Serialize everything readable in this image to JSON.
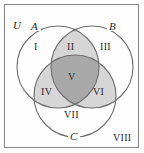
{
  "figure": {
    "kind": "venn-diagram-three-sets",
    "background_color": "#fefefe",
    "frame_color": "#8a8a8a",
    "outline_color": "#6e6e6e",
    "shade_light": "#d6d6d6",
    "shade_dark": "#a9a9a9",
    "text_color": "#2a2a2a"
  },
  "universe": {
    "label": "U"
  },
  "sets": [
    {
      "id": "A",
      "label": "A",
      "position": "top-left"
    },
    {
      "id": "B",
      "label": "B",
      "position": "top-right"
    },
    {
      "id": "C",
      "label": "C",
      "position": "bottom-center"
    }
  ],
  "regions": [
    {
      "id": "I",
      "label": "I",
      "description": "A only",
      "shaded": false,
      "shade": "none"
    },
    {
      "id": "II",
      "label": "II",
      "description": "A and B only",
      "shaded": true,
      "shade": "light"
    },
    {
      "id": "III",
      "label": "III",
      "description": "B only",
      "shaded": false,
      "shade": "none"
    },
    {
      "id": "IV",
      "label": "IV",
      "description": "A and C only",
      "shaded": true,
      "shade": "light"
    },
    {
      "id": "V",
      "label": "V",
      "description": "A and B and C",
      "shaded": true,
      "shade": "dark"
    },
    {
      "id": "VI",
      "label": "VI",
      "description": "B and C only",
      "shaded": true,
      "shade": "light"
    },
    {
      "id": "VII",
      "label": "VII",
      "description": "C only",
      "shaded": false,
      "shade": "none"
    },
    {
      "id": "VIII",
      "label": "VIII",
      "description": "outside A, B and C",
      "shaded": false,
      "shade": "none"
    }
  ]
}
